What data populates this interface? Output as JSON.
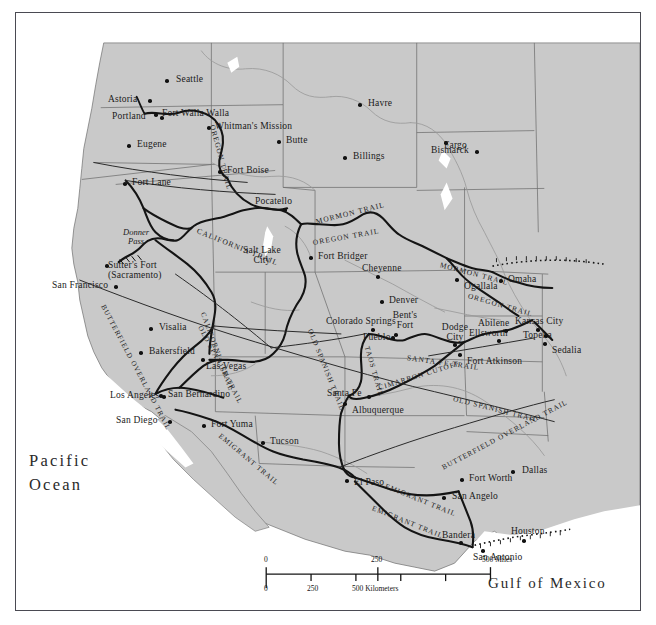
{
  "map": {
    "title": "Western United States Historic Trails Map",
    "background_color": "#ffffff",
    "land_color": "#c9c9c9",
    "water_color": "#ffffff",
    "state_border_color": "#6e6e6e",
    "trail_color": "#141414",
    "river_color": "#8c8c8c",
    "frame_color": "#4a4a52"
  },
  "ocean_labels": [
    {
      "name": "pacific-ocean",
      "line1": "Pacific",
      "line2": "Ocean",
      "x": 28,
      "y": 448
    },
    {
      "name": "gulf-of-mexico",
      "line1": "Gulf of Mexico",
      "line2": "",
      "x": 487,
      "y": 570
    }
  ],
  "cities": [
    {
      "label": "Seattle",
      "x": 160,
      "y": 62,
      "dot_dx": -11,
      "dot_dy": 4,
      "align": "left"
    },
    {
      "label": "Astoria",
      "x": 92,
      "y": 82,
      "dot_dx": 40,
      "dot_dy": 4,
      "align": "left"
    },
    {
      "label": "Portland",
      "x": 96,
      "y": 99,
      "dot_dx": 48,
      "dot_dy": 4,
      "align": "left"
    },
    {
      "label": "Fort Walla Walla",
      "x": 146,
      "y": 96,
      "dot_dx": -8,
      "dot_dy": 4,
      "align": "left"
    },
    {
      "label": "Whitman's Mission",
      "x": 199,
      "y": 109,
      "dot_dx": -8,
      "dot_dy": 4,
      "align": "left"
    },
    {
      "label": "Eugene",
      "x": 121,
      "y": 127,
      "dot_dx": -10,
      "dot_dy": 4,
      "align": "left"
    },
    {
      "label": "Havre",
      "x": 352,
      "y": 86,
      "dot_dx": -10,
      "dot_dy": 4,
      "align": "left"
    },
    {
      "label": "Butte",
      "x": 270,
      "y": 123,
      "dot_dx": -9,
      "dot_dy": 4,
      "align": "left"
    },
    {
      "label": "Billings",
      "x": 337,
      "y": 139,
      "dot_dx": -10,
      "dot_dy": 4,
      "align": "left"
    },
    {
      "label": "Bismarck",
      "x": 415,
      "y": 133,
      "dot_dx": 44,
      "dot_dy": 4,
      "align": "left"
    },
    {
      "label": "Fargo",
      "x": 428,
      "y": 128,
      "dot_dx": 0,
      "dot_dy": 0,
      "align": "left"
    },
    {
      "label": "Fort Boise",
      "x": 211,
      "y": 153,
      "dot_dx": -9,
      "dot_dy": 4,
      "align": "left"
    },
    {
      "label": "Fort Lane",
      "x": 116,
      "y": 165,
      "dot_dx": -9,
      "dot_dy": 4,
      "align": "left"
    },
    {
      "label": "Pocatello",
      "x": 239,
      "y": 184,
      "dot_dx": 28,
      "dot_dy": 11,
      "align": "left"
    },
    {
      "label": "Fort Bridger",
      "x": 302,
      "y": 239,
      "dot_dx": -9,
      "dot_dy": 4,
      "align": "left"
    },
    {
      "label": "Cheyenne",
      "x": 346,
      "y": 251,
      "dot_dx": 14,
      "dot_dy": 11,
      "align": "left"
    },
    {
      "label": "Ogallala",
      "x": 448,
      "y": 269,
      "dot_dx": -9,
      "dot_dy": -4,
      "align": "left"
    },
    {
      "label": "Omaha",
      "x": 492,
      "y": 262,
      "dot_dx": -9,
      "dot_dy": 4,
      "align": "left"
    },
    {
      "label": "San Francisco",
      "x": 36,
      "y": 268,
      "dot_dx": 62,
      "dot_dy": 4,
      "align": "left"
    },
    {
      "label": "Denver",
      "x": 373,
      "y": 283,
      "dot_dx": -9,
      "dot_dy": 4,
      "align": "left"
    },
    {
      "label": "Colorado Springs",
      "x": 310,
      "y": 304,
      "dot_dx": 45,
      "dot_dy": 11,
      "align": "left"
    },
    {
      "label": "Pueblo",
      "x": 347,
      "y": 320,
      "dot_dx": 28,
      "dot_dy": 3,
      "align": "left"
    },
    {
      "label": "Abilene",
      "x": 462,
      "y": 306,
      "dot_dx": 26,
      "dot_dy": 10,
      "align": "left"
    },
    {
      "label": "Kansas City",
      "x": 499,
      "y": 304,
      "dot_dx": 21,
      "dot_dy": 11,
      "align": "left"
    },
    {
      "label": "Ellsworth",
      "x": 453,
      "y": 316,
      "dot_dx": 28,
      "dot_dy": 10,
      "align": "left"
    },
    {
      "label": "Topeka",
      "x": 507,
      "y": 318,
      "dot_dx": 21,
      "dot_dy": 3,
      "align": "left"
    },
    {
      "label": "Sedalia",
      "x": 536,
      "y": 333,
      "dot_dx": -9,
      "dot_dy": -4,
      "align": "left"
    },
    {
      "label": "Dodge City",
      "x": 435,
      "y": 318,
      "dot_dx": 18,
      "dot_dy": 14,
      "align": "left",
      "two": true
    },
    {
      "label": "Fort Atkinson",
      "x": 451,
      "y": 344,
      "dot_dx": -9,
      "dot_dy": -4,
      "align": "left"
    },
    {
      "label": "Visalia",
      "x": 143,
      "y": 310,
      "dot_dx": -10,
      "dot_dy": 4,
      "align": "left"
    },
    {
      "label": "Bakersfield",
      "x": 133,
      "y": 334,
      "dot_dx": -10,
      "dot_dy": 4,
      "align": "left"
    },
    {
      "label": "Las Vegas",
      "x": 190,
      "y": 349,
      "dot_dx": -5,
      "dot_dy": -4,
      "align": "left"
    },
    {
      "label": "Los Angeles",
      "x": 94,
      "y": 378,
      "dot_dx": 52,
      "dot_dy": 4,
      "align": "left"
    },
    {
      "label": "San Bernardino",
      "x": 152,
      "y": 377,
      "dot_dx": -9,
      "dot_dy": 4,
      "align": "left"
    },
    {
      "label": "San Diego",
      "x": 100,
      "y": 403,
      "dot_dx": 52,
      "dot_dy": 4,
      "align": "left"
    },
    {
      "label": "Santa Fe",
      "x": 311,
      "y": 376,
      "dot_dx": 40,
      "dot_dy": 6,
      "align": "left"
    },
    {
      "label": "Albuquerque",
      "x": 336,
      "y": 393,
      "dot_dx": -9,
      "dot_dy": -4,
      "align": "left"
    },
    {
      "label": "Fort Yuma",
      "x": 195,
      "y": 407,
      "dot_dx": -9,
      "dot_dy": 4,
      "align": "left"
    },
    {
      "label": "Tucson",
      "x": 254,
      "y": 424,
      "dot_dx": -9,
      "dot_dy": 4,
      "align": "left"
    },
    {
      "label": "El Paso",
      "x": 338,
      "y": 465,
      "dot_dx": -9,
      "dot_dy": 1,
      "align": "left"
    },
    {
      "label": "Fort Worth",
      "x": 453,
      "y": 461,
      "dot_dx": -9,
      "dot_dy": 4,
      "align": "left"
    },
    {
      "label": "Dallas",
      "x": 506,
      "y": 453,
      "dot_dx": -11,
      "dot_dy": 4,
      "align": "left"
    },
    {
      "label": "San Angelo",
      "x": 436,
      "y": 479,
      "dot_dx": -10,
      "dot_dy": 4,
      "align": "left"
    },
    {
      "label": "Bandera",
      "x": 426,
      "y": 518,
      "dot_dx": 17,
      "dot_dy": 10,
      "align": "left"
    },
    {
      "label": "Houston",
      "x": 495,
      "y": 514,
      "dot_dx": 11,
      "dot_dy": 12,
      "align": "left"
    },
    {
      "label": "San Antonio",
      "x": 457,
      "y": 540,
      "dot_dx": 8,
      "dot_dy": -4,
      "align": "left"
    },
    {
      "label": "Bent's Fort",
      "x": 386,
      "y": 306,
      "dot_dx": 6,
      "dot_dy": 17,
      "align": "left",
      "two": true
    }
  ],
  "special_labels": [
    {
      "name": "donner-pass",
      "line1": "Donner",
      "line2": "Pass",
      "x": 108,
      "y": 226
    },
    {
      "name": "sutters-fort",
      "line1": "Sutter's Fort",
      "line2": "(Sacramento)",
      "x": 107,
      "y": 258
    },
    {
      "name": "salt-lake-city",
      "line1": "Salt Lake",
      "line2": "City",
      "x": 237,
      "y": 244
    },
    {
      "name": "bents-fort",
      "line1": "Bent's",
      "line2": "Fort",
      "x": 386,
      "y": 306
    },
    {
      "name": "dodge-city",
      "line1": "Dodge",
      "line2": "City",
      "x": 435,
      "y": 318
    }
  ],
  "trail_labels": [
    {
      "name": "oregon-trail-nw",
      "text": "OREGON TRAIL",
      "x": 196,
      "y": 108,
      "rot": 75,
      "size": 7.4
    },
    {
      "name": "california-trail-west",
      "text": "CALIFORNIA TRAIL",
      "x": 181,
      "y": 214,
      "rot": 22,
      "size": 7.6
    },
    {
      "name": "mormon-trail-wy",
      "text": "MORMON TRAIL",
      "x": 300,
      "y": 205,
      "rot": -14,
      "size": 7.4
    },
    {
      "name": "oregon-trail-wy",
      "text": "OREGON TRAIL",
      "x": 297,
      "y": 226,
      "rot": -10,
      "size": 7.4
    },
    {
      "name": "mormon-trail-ne",
      "text": "MORMON TRAIL",
      "x": 424,
      "y": 248,
      "rot": 15,
      "size": 7.4
    },
    {
      "name": "oregon-trail-ne",
      "text": "OREGON TRAIL",
      "x": 452,
      "y": 279,
      "rot": 16,
      "size": 7.4
    },
    {
      "name": "butterfield-overland-ca",
      "text": "BUTTERFIELD OVERLAND TRAIL",
      "x": 86,
      "y": 289,
      "rot": 62,
      "size": 7.2
    },
    {
      "name": "california-trail-nv",
      "text": "CALIFORNIA TRAIL",
      "x": 186,
      "y": 296,
      "rot": 70,
      "size": 7.2
    },
    {
      "name": "old-spanish-trail-ut",
      "text": "OLD SPANISH TRAIL",
      "x": 183,
      "y": 310,
      "rot": 62,
      "size": 7.2
    },
    {
      "name": "old-spanish-trail-co",
      "text": "OLD SPANISH TRAIL",
      "x": 293,
      "y": 313,
      "rot": 68,
      "size": 7.2
    },
    {
      "name": "taos-trail",
      "text": "TAOS TRAIL",
      "x": 350,
      "y": 330,
      "rot": 74,
      "size": 7.2
    },
    {
      "name": "santa-fe-trail",
      "text": "SANTA FE TRAIL",
      "x": 391,
      "y": 341,
      "rot": 8,
      "size": 7.4
    },
    {
      "name": "cimarron-cutoff",
      "text": "CIMARRON CUTOFF",
      "x": 363,
      "y": 372,
      "rot": -17,
      "size": 7.2
    },
    {
      "name": "old-spanish-trail-tx",
      "text": "OLD SPANISH TRAIL",
      "x": 437,
      "y": 383,
      "rot": 14,
      "size": 7.2
    },
    {
      "name": "butterfield-overland-tx",
      "text": "BUTTERFIELD OVERLAND TRAIL",
      "x": 427,
      "y": 452,
      "rot": -28,
      "size": 7.2
    },
    {
      "name": "emigrant-trail-az",
      "text": "EMIGRANT TRAIL",
      "x": 203,
      "y": 419,
      "rot": 40,
      "size": 7.2
    },
    {
      "name": "emigrant-trail-tx-n",
      "text": "EMIGRANT TRAIL",
      "x": 369,
      "y": 470,
      "rot": 22,
      "size": 7.2
    },
    {
      "name": "emigrant-trail-tx-s",
      "text": "EMIGRANT TRAIL",
      "x": 356,
      "y": 492,
      "rot": 22,
      "size": 7.2
    }
  ],
  "scale_bar": {
    "name": "scale-bar",
    "miles_ticks": [
      "0",
      "250",
      "500 Miles"
    ],
    "km_ticks": [
      "0",
      "250",
      "500 Kilometers"
    ],
    "x": 266,
    "y": 561,
    "width": 225
  }
}
